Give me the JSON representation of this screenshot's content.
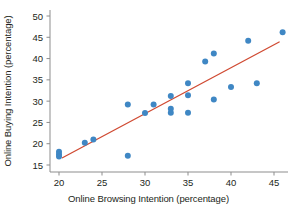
{
  "chart_data": {
    "type": "scatter",
    "title": "",
    "xlabel": "Online Browsing Intention (percentage)",
    "ylabel": "Online Buying Intention (percentage)",
    "xlim": [
      18.5,
      47.0
    ],
    "ylim": [
      14.0,
      51.5
    ],
    "xticks": [
      20,
      25,
      30,
      35,
      40,
      45
    ],
    "yticks": [
      15,
      20,
      25,
      30,
      35,
      40,
      45,
      50
    ],
    "xtick_labels": [
      "20",
      "25",
      "30",
      "35",
      "40",
      "45"
    ],
    "ytick_labels": [
      "15",
      "20",
      "25",
      "30",
      "35",
      "40",
      "45",
      "50"
    ],
    "grid": false,
    "legend": null,
    "point_color": "#3f87c4",
    "line_color": "#d04a32",
    "axis_color": "#8d8d8d",
    "text_color": "#231f20",
    "marker_size": 3.0,
    "series": [
      {
        "name": "Observations",
        "type": "scatter",
        "points": [
          [
            20.0,
            18.1
          ],
          [
            20.0,
            17.5
          ],
          [
            20.0,
            17.0
          ],
          [
            23.0,
            20.2
          ],
          [
            24.0,
            21.0
          ],
          [
            28.0,
            29.2
          ],
          [
            28.0,
            17.2
          ],
          [
            30.0,
            27.2
          ],
          [
            31.0,
            29.2
          ],
          [
            33.0,
            31.2
          ],
          [
            33.0,
            28.2
          ],
          [
            33.0,
            27.3
          ],
          [
            35.0,
            34.2
          ],
          [
            35.0,
            31.4
          ],
          [
            35.0,
            27.3
          ],
          [
            37.0,
            39.3
          ],
          [
            38.0,
            41.2
          ],
          [
            38.0,
            30.4
          ],
          [
            40.0,
            33.3
          ],
          [
            42.0,
            44.2
          ],
          [
            43.0,
            34.2
          ],
          [
            46.0,
            46.2
          ]
        ]
      },
      {
        "name": "Linear fit",
        "type": "line",
        "endpoints": [
          [
            20.4,
            16.7
          ],
          [
            45.6,
            43.9
          ]
        ]
      }
    ]
  },
  "figure": {
    "axis_title_x": "Online Browsing Intention (percentage)",
    "axis_title_y": "Online Buying Intention (percentage)"
  }
}
